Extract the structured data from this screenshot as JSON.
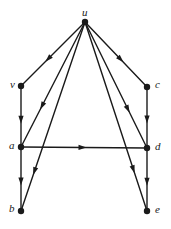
{
  "figure": {
    "kind": "directed-graph",
    "background_color": "#ffffff",
    "stroke_color": "#1a1a1a",
    "node_fill_color": "#1a1a1a",
    "width": 171,
    "height": 229
  },
  "nodes": [
    {
      "id": "u",
      "label": "u",
      "x": 85,
      "y": 22,
      "label_x": 82,
      "label_y": 7
    },
    {
      "id": "v",
      "label": "v",
      "x": 21,
      "y": 86,
      "label_x": 10,
      "label_y": 79
    },
    {
      "id": "c",
      "label": "c",
      "x": 147,
      "y": 87,
      "label_x": 155,
      "label_y": 79
    },
    {
      "id": "a",
      "label": "a",
      "x": 21,
      "y": 147,
      "label_x": 9,
      "label_y": 140
    },
    {
      "id": "d",
      "label": "d",
      "x": 147,
      "y": 148,
      "label_x": 155,
      "label_y": 141
    },
    {
      "id": "b",
      "label": "b",
      "x": 21,
      "y": 211,
      "label_x": 9,
      "label_y": 203
    },
    {
      "id": "e",
      "label": "e",
      "x": 147,
      "y": 211,
      "label_x": 155,
      "label_y": 204
    }
  ],
  "edges": [
    {
      "id": "u-v",
      "from": "u",
      "to": "v",
      "arrow_t": 0.62,
      "name": "edge-u-to-v"
    },
    {
      "id": "u-a",
      "from": "u",
      "to": "a",
      "arrow_t": 0.7,
      "name": "edge-u-to-a"
    },
    {
      "id": "u-b",
      "from": "u",
      "to": "b",
      "arrow_t": 0.81,
      "name": "edge-u-to-b"
    },
    {
      "id": "u-d",
      "from": "u",
      "to": "d",
      "arrow_t": 0.72,
      "name": "edge-u-to-d"
    },
    {
      "id": "u-e",
      "from": "u",
      "to": "e",
      "arrow_t": 0.8,
      "name": "edge-u-to-e"
    },
    {
      "id": "u-c",
      "from": "u",
      "to": "c",
      "arrow_t": 0.62,
      "name": "edge-u-to-c"
    },
    {
      "id": "v-a",
      "from": "v",
      "to": "a",
      "arrow_t": 0.62,
      "name": "edge-v-to-a"
    },
    {
      "id": "a-b",
      "from": "a",
      "to": "b",
      "arrow_t": 0.6,
      "name": "edge-a-to-b"
    },
    {
      "id": "c-d",
      "from": "c",
      "to": "d",
      "arrow_t": 0.6,
      "name": "edge-c-to-d"
    },
    {
      "id": "d-e",
      "from": "d",
      "to": "e",
      "arrow_t": 0.6,
      "name": "edge-d-to-e"
    },
    {
      "id": "a-d",
      "from": "a",
      "to": "d",
      "arrow_t": 0.52,
      "name": "edge-a-to-d"
    }
  ],
  "style": {
    "node_radius": 3.2,
    "edge_width": 1.4,
    "arrow_length": 8,
    "arrow_half_width": 2.6
  }
}
